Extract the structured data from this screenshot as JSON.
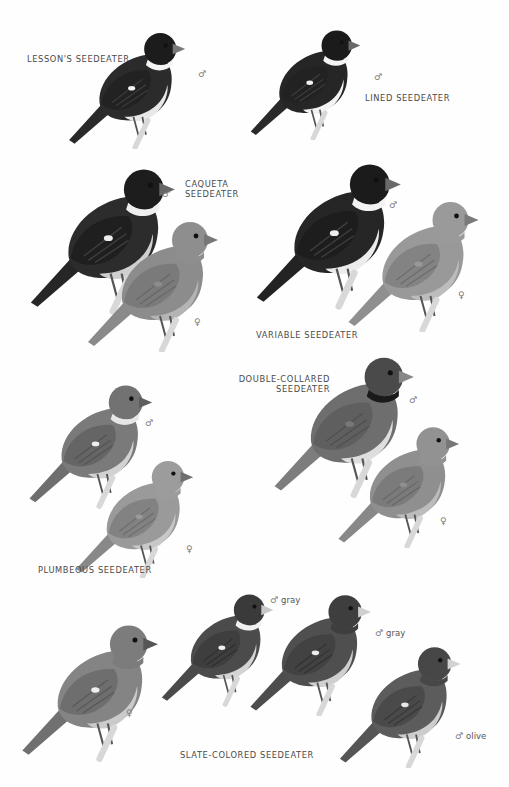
{
  "plate": {
    "background": "#fefefe",
    "species": [
      {
        "id": "lessons",
        "name": "LESSON'S SEEDEATER",
        "birds": [
          {
            "sex": "♂",
            "morph": ""
          }
        ]
      },
      {
        "id": "lined",
        "name": "LINED SEEDEATER",
        "birds": [
          {
            "sex": "♂",
            "morph": ""
          }
        ]
      },
      {
        "id": "caqueta",
        "name_line1": "CAQUETA",
        "name_line2": "SEEDEATER",
        "birds": [
          {
            "sex": "♂",
            "morph": ""
          },
          {
            "sex": "♀",
            "morph": ""
          }
        ]
      },
      {
        "id": "variable",
        "name": "VARIABLE SEEDEATER",
        "birds": [
          {
            "sex": "♂",
            "morph": ""
          },
          {
            "sex": "♀",
            "morph": ""
          }
        ]
      },
      {
        "id": "double-collared",
        "name_line1": "DOUBLE-COLLARED",
        "name_line2": "SEEDEATER",
        "birds": [
          {
            "sex": "♂",
            "morph": ""
          },
          {
            "sex": "♀",
            "morph": ""
          }
        ]
      },
      {
        "id": "plumbeous",
        "name": "PLUMBEOUS SEEDEATER",
        "birds": [
          {
            "sex": "♂",
            "morph": ""
          },
          {
            "sex": "♀",
            "morph": ""
          }
        ]
      },
      {
        "id": "slate-colored",
        "name": "SLATE-COLORED SEEDEATER",
        "birds": [
          {
            "sex": "♀",
            "morph": ""
          },
          {
            "sex": "♂",
            "morph": "gray"
          },
          {
            "sex": "♂",
            "morph": "gray"
          },
          {
            "sex": "♂",
            "morph": "olive"
          }
        ]
      }
    ]
  }
}
